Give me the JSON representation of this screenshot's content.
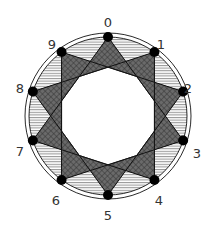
{
  "diagram": {
    "type": "decagram-star-polygon",
    "schlafli": "{10/3}",
    "center": [
      108,
      116
    ],
    "vertex_radius": 79,
    "outer_ring_radii": [
      79,
      83
    ],
    "vertex_dot_radius": 5,
    "colors": {
      "background": "#ffffff",
      "stroke": "#111111",
      "dot": "#000000",
      "tip_fill": "#6e6e6e",
      "hatch": "#444444",
      "label": "#333333"
    },
    "vertices": [
      {
        "label": "0",
        "label_pos": [
          108,
          22
        ]
      },
      {
        "label": "1",
        "label_pos": [
          161,
          44
        ]
      },
      {
        "label": "2",
        "label_pos": [
          188,
          88
        ]
      },
      {
        "label": "3",
        "label_pos": [
          197,
          153
        ]
      },
      {
        "label": "4",
        "label_pos": [
          159,
          200
        ]
      },
      {
        "label": "5",
        "label_pos": [
          108,
          215
        ]
      },
      {
        "label": "6",
        "label_pos": [
          56,
          200
        ]
      },
      {
        "label": "7",
        "label_pos": [
          20,
          151
        ]
      },
      {
        "label": "8",
        "label_pos": [
          20,
          88
        ]
      },
      {
        "label": "9",
        "label_pos": [
          52,
          44
        ]
      }
    ],
    "step": 3,
    "regions": {
      "tips": "cross-hatched dark triangles at each vertex",
      "outer_segments": "horizontal hatching between circle and chords",
      "bands": "diagonal hatching between tips",
      "core": "white decagon"
    }
  }
}
